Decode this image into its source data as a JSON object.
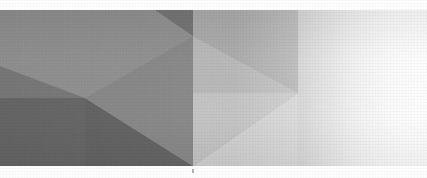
{
  "image": {
    "kind": "abstract-geometric-banner",
    "width": 427,
    "height": 178,
    "alt_text": "Low-poly abstract grayscale banner with triangular facets fading to white on the right",
    "background_color": "#ffffff",
    "top_margin_band_height": 10,
    "bottom_margin_band_height": 12,
    "artwork_top": 10,
    "artwork_bottom": 166,
    "grain": "fine film grain / scanned halftone texture"
  },
  "palette": {
    "white": "#ffffff",
    "near_white": "#fbfbfb",
    "lightest_facet": "#d6d6d6",
    "light_facet": "#c3c3c3",
    "mid_light_facet": "#b0b0b0",
    "mid_facet": "#9a9a9a",
    "mid_dark_facet": "#8a8a8a",
    "dark_facet": "#7a7a7a",
    "darker_facet": "#6d6d6d",
    "darkest_facet": "#5f5f5f",
    "deep_shadow": "#585858"
  },
  "geometry": {
    "description": "Polygonal low-poly facets across the banner, lightening toward the right edge",
    "key_vertices": [
      {
        "name": "top-center-vertex",
        "x": 193,
        "y": 36
      },
      {
        "name": "left-mid-vertex",
        "x": 85,
        "y": 98
      },
      {
        "name": "right-mid-vertex",
        "x": 298,
        "y": 93
      },
      {
        "name": "bottom-center-vertex",
        "x": 193,
        "y": 166
      },
      {
        "name": "left-edge-upper",
        "x": 0,
        "y": 66
      },
      {
        "name": "center-spine-top",
        "x": 193,
        "y": 10
      },
      {
        "name": "center-spine-bottom",
        "x": 193,
        "y": 166
      }
    ],
    "facets": [
      {
        "id": "f1",
        "name": "upper-left-field",
        "points": "0,10 193,10 193,36 85,98 0,66",
        "fill": "#8d8d8d"
      },
      {
        "id": "f2",
        "name": "upper-left-wedge",
        "points": "0,66 85,98 0,98",
        "fill": "#757575"
      },
      {
        "id": "f3",
        "name": "left-lower-block",
        "points": "0,98 85,98 85,166 0,166",
        "fill": "#626262"
      },
      {
        "id": "f4",
        "name": "lower-center-dark-triangle",
        "points": "85,98 193,166 85,166",
        "fill": "#5e5e5e"
      },
      {
        "id": "f5",
        "name": "center-left-upper-triangle",
        "points": "85,98 193,36 193,166",
        "fill": "#848484"
      },
      {
        "id": "f6",
        "name": "top-center-small-dark",
        "points": "155,10 193,10 193,36",
        "fill": "#6f6f6f"
      },
      {
        "id": "f7",
        "name": "top-right-panel",
        "points": "193,10 298,10 298,93 193,36",
        "fill": "#a8a8a8"
      },
      {
        "id": "f8",
        "name": "right-upper-triangle",
        "points": "193,36 298,93 193,93",
        "fill": "#b6b6b6"
      },
      {
        "id": "f9",
        "name": "center-right-lower-triangle",
        "points": "193,93 298,93 193,166",
        "fill": "#c2c2c2"
      },
      {
        "id": "f10",
        "name": "bottom-right-wedge",
        "points": "193,166 298,93 298,166",
        "fill": "#cfcfcf"
      },
      {
        "id": "f11",
        "name": "far-right-fade-panel",
        "points": "298,10 427,10 427,166 298,166",
        "fill": "gradient-right-fade"
      }
    ]
  },
  "gradients": {
    "right_fade": {
      "name": "right-fade-to-white",
      "direction": "horizontal",
      "stops": [
        {
          "offset": "0%",
          "color": "#c8c8c8"
        },
        {
          "offset": "35%",
          "color": "#e0e0e0"
        },
        {
          "offset": "70%",
          "color": "#f4f4f4"
        },
        {
          "offset": "100%",
          "color": "#ffffff"
        }
      ]
    },
    "global_light_sweep": {
      "name": "global-left-to-right-lightening",
      "direction": "horizontal",
      "stops": [
        {
          "offset": "0%",
          "color": "rgba(255,255,255,0)"
        },
        {
          "offset": "55%",
          "color": "rgba(255,255,255,0.05)"
        },
        {
          "offset": "80%",
          "color": "rgba(255,255,255,0.45)"
        },
        {
          "offset": "100%",
          "color": "rgba(255,255,255,0.95)"
        }
      ]
    },
    "top_vignette": {
      "name": "top-soft-darkening",
      "direction": "vertical",
      "stops": [
        {
          "offset": "0%",
          "color": "rgba(0,0,0,0.05)"
        },
        {
          "offset": "30%",
          "color": "rgba(0,0,0,0)"
        }
      ]
    }
  },
  "artifacts": [
    {
      "name": "bottom-center-speck",
      "x": 193,
      "y": 170,
      "width": 2,
      "height": 4,
      "color": "#9a9a9a"
    }
  ]
}
